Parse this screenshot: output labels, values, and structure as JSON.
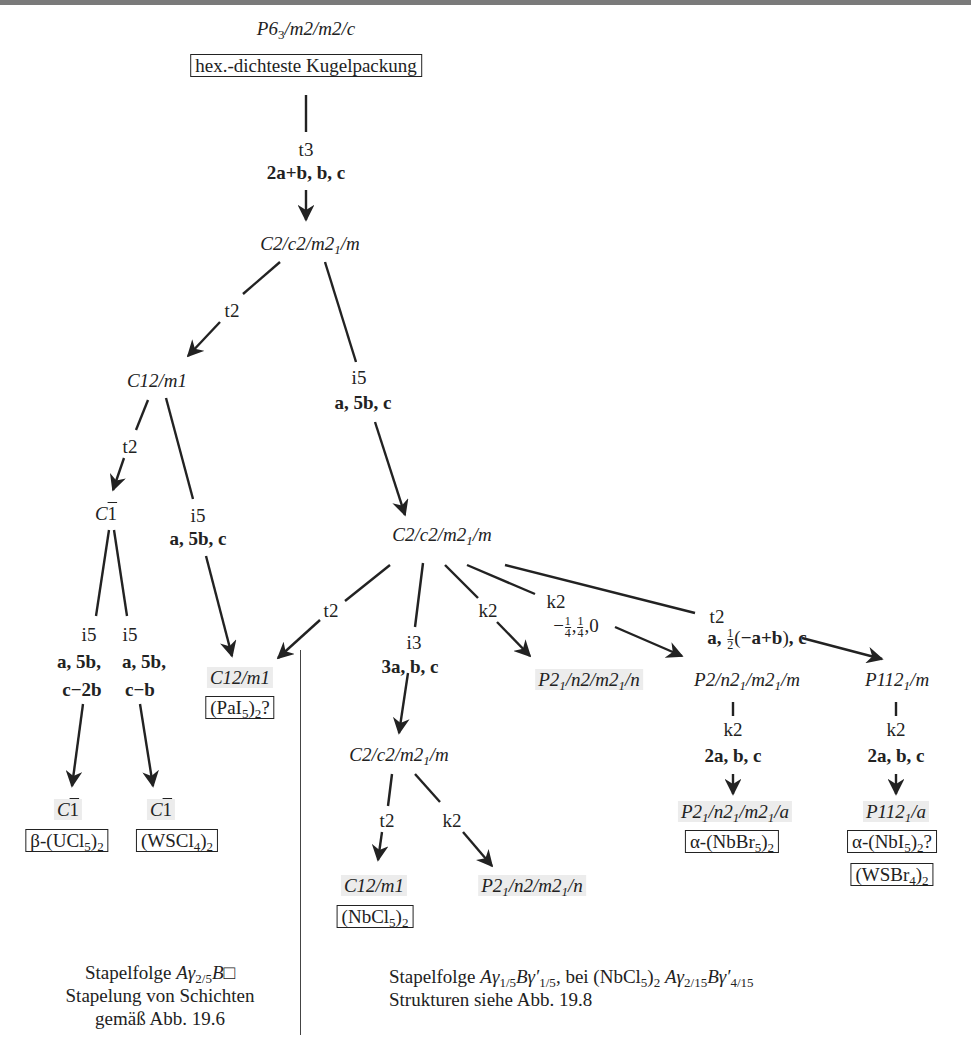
{
  "nodes": {
    "root_sg": "P6₃/m2/m2/c",
    "root_label": "hex.-dichteste Kugelpackung",
    "n1": "C2/c2/m2₁/m",
    "n2": "C12/m1",
    "n3": "C1̄",
    "n4": "C2/c2/m2₁/m",
    "n5_left": "C1̄",
    "n5_left_compound": "β-(UCl₅)₂",
    "n5_right": "C1̄",
    "n5_right_compound": "(WSCl₄)₂",
    "n6": "C12/m1",
    "n6_compound": "(PaI₅)₂?",
    "n7": "C2/c2/m2₁/m",
    "n8": "P2₁/n2/m2₁/n",
    "n9": "P2/n2₁/m2₁/m",
    "n10": "P112₁/m",
    "n11": "C12/m1",
    "n11_compound": "(NbCl₅)₂",
    "n12": "P2₁/n2/m2₁/n",
    "n13": "P2₁/n2₁/m2₁/a",
    "n13_compound": "α-(NbBr₅)₂",
    "n14": "P112₁/a",
    "n14_compound_1": "α-(NbI₅)₂?",
    "n14_compound_2": "(WSBr₄)₂"
  },
  "edges": {
    "e_root_n1": {
      "type": "t3",
      "transform": "2a+b, b, c"
    },
    "e_n1_n2": {
      "type": "t2"
    },
    "e_n1_n4": {
      "type": "i5",
      "transform": "a, 5b, c"
    },
    "e_n2_n3": {
      "type": "t2"
    },
    "e_n2_n6": {
      "type": "i5",
      "transform": "a, 5b, c"
    },
    "e_n3_left": {
      "type": "i5",
      "transform_1": "a, 5b,",
      "transform_2": "c−2b"
    },
    "e_n3_right": {
      "type": "i5",
      "transform_1": "a, 5b,",
      "transform_2": "c−b"
    },
    "e_n4_n6": {
      "type": "t2"
    },
    "e_n4_n7": {
      "type": "i3",
      "transform": "3a, b, c"
    },
    "e_n4_n8": {
      "type": "k2"
    },
    "e_n4_n9": {
      "type": "k2",
      "origin": "−1/4, 1/4, 0"
    },
    "e_n4_n10": {
      "type": "t2",
      "transform": "a, 1/2(−a+b), c"
    },
    "e_n7_n11": {
      "type": "t2"
    },
    "e_n7_n12": {
      "type": "k2"
    },
    "e_n9_n13": {
      "type": "k2",
      "transform": "2a, b, c"
    },
    "e_n10_n14": {
      "type": "k2",
      "transform": "2a, b, c"
    }
  },
  "captions": {
    "left_line1": "Stapelfolge Aγ2/5B□",
    "left_line2": "Stapelung von Schichten",
    "left_line3": "gemäß Abb. 19.6",
    "right_line1": "Stapelfolge Aγ1/5Bγ′1/5, bei (NbCl5)2 Aγ2/15Bγ′4/15",
    "right_line2": "Strukturen siehe Abb. 19.8"
  },
  "colors": {
    "ink": "#222222",
    "highlight": "#ececec",
    "topline": "#7a7a7a"
  }
}
